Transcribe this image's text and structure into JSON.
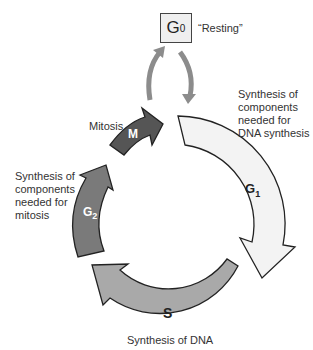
{
  "diagram": {
    "g0": {
      "letter": "G",
      "subscript": "0",
      "caption": "“Resting”"
    },
    "phases": [
      {
        "id": "M",
        "letter": "M",
        "subscript": "",
        "name": "Mitosis",
        "description": [
          "Mitosis"
        ],
        "fill": "#555555"
      },
      {
        "id": "G1",
        "letter": "G",
        "subscript": "1",
        "description": [
          "Synthesis of",
          "components",
          "needed for",
          "DNA synthesis"
        ],
        "fill": "#f3f3f3"
      },
      {
        "id": "S",
        "letter": "S",
        "subscript": "",
        "description": [
          "Synthesis of DNA"
        ],
        "fill": "#a9a9a9"
      },
      {
        "id": "G2",
        "letter": "G",
        "subscript": "2",
        "description": [
          "Synthesis of",
          "components",
          "needed for",
          "mitosis"
        ],
        "fill": "#7a7a7a"
      }
    ],
    "connector_color": "#8c8c8c",
    "outline_color": "#222222"
  }
}
